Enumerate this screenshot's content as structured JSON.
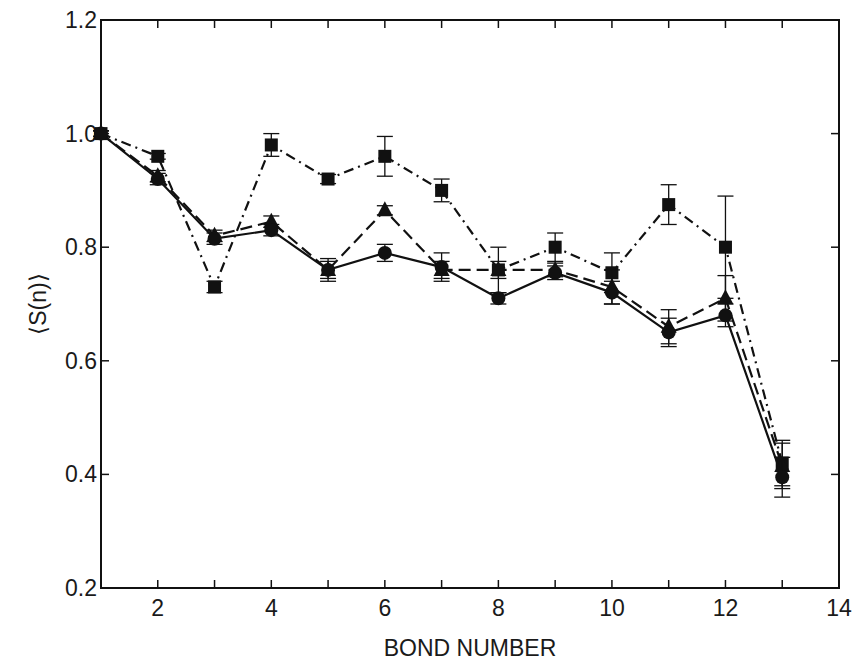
{
  "chart_data": {
    "type": "line",
    "title": "",
    "xlabel": "BOND NUMBER",
    "ylabel": "⟨S(n)⟩",
    "xlim": [
      1,
      14
    ],
    "ylim": [
      0.2,
      1.2
    ],
    "x_ticks": [
      2,
      4,
      6,
      8,
      10,
      12,
      14
    ],
    "x_tick_labels": [
      "2",
      "4",
      "6",
      "8",
      "10",
      "12",
      "14"
    ],
    "x_minor_ticks": [
      3,
      5,
      7,
      9,
      11,
      13
    ],
    "y_ticks": [
      0.2,
      0.4,
      0.6,
      0.8,
      1.0,
      1.2
    ],
    "y_tick_labels": [
      "0.2",
      "0.4",
      "0.6",
      "0.8",
      "1.0",
      "1.2"
    ],
    "grid": false,
    "legend": null,
    "x": [
      1,
      2,
      3,
      4,
      5,
      6,
      7,
      8,
      9,
      10,
      11,
      12,
      13
    ],
    "series": [
      {
        "name": "squares (dash-dot)",
        "marker": "square",
        "line_style": "dash-dot",
        "values": [
          1.0,
          0.96,
          0.73,
          0.98,
          0.92,
          0.96,
          0.9,
          0.76,
          0.8,
          0.755,
          0.875,
          0.8,
          0.42
        ],
        "errors": [
          0.005,
          0.005,
          0.01,
          0.02,
          0.008,
          0.035,
          0.02,
          0.04,
          0.025,
          0.035,
          0.035,
          0.09,
          0.04
        ]
      },
      {
        "name": "triangles (dashed)",
        "marker": "triangle",
        "line_style": "dashed",
        "values": [
          1.0,
          0.925,
          0.82,
          0.845,
          0.76,
          0.865,
          0.76,
          0.76,
          0.76,
          0.73,
          0.66,
          0.71,
          0.415
        ],
        "errors": [
          0.005,
          0.01,
          0.01,
          0.01,
          0.015,
          0.008,
          0.015,
          0.015,
          0.012,
          0.03,
          0.03,
          0.04,
          0.04
        ]
      },
      {
        "name": "circles (solid)",
        "marker": "circle",
        "line_style": "solid",
        "values": [
          1.0,
          0.92,
          0.815,
          0.83,
          0.76,
          0.79,
          0.765,
          0.71,
          0.755,
          0.72,
          0.65,
          0.68,
          0.395
        ],
        "errors": [
          0.005,
          0.01,
          0.01,
          0.01,
          0.02,
          0.015,
          0.025,
          0.01,
          0.012,
          0.02,
          0.025,
          0.02,
          0.035
        ]
      }
    ],
    "colors": {
      "ink": "#111111",
      "background": "#ffffff"
    }
  }
}
